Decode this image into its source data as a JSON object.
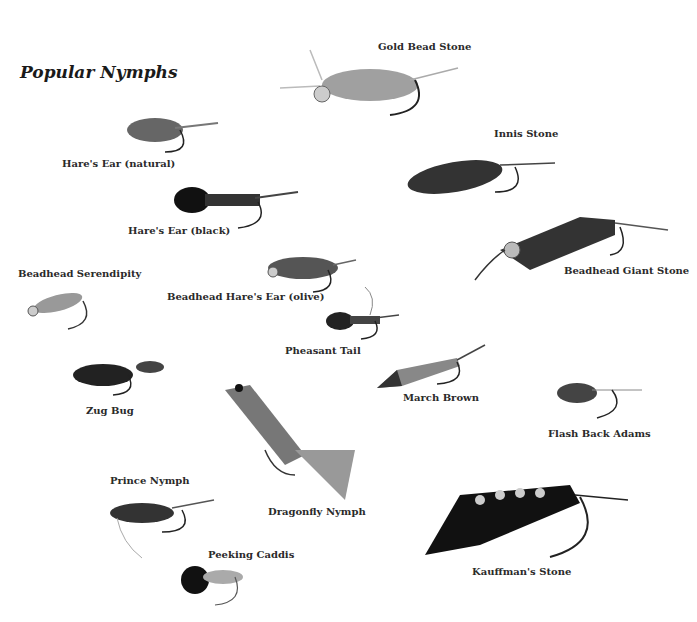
{
  "title": "Popular Nymphs",
  "flies": [
    {
      "name": "Gold Bead Stone"
    },
    {
      "name": "Hare's Ear (natural)"
    },
    {
      "name": "Innis Stone"
    },
    {
      "name": "Hare's Ear (black)"
    },
    {
      "name": "Beadhead Giant Stone"
    },
    {
      "name": "Beadhead Serendipity"
    },
    {
      "name": "Beadhead Hare's Ear (olive)"
    },
    {
      "name": "Pheasant Tail"
    },
    {
      "name": "Zug Bug"
    },
    {
      "name": "March Brown"
    },
    {
      "name": "Flash Back Adams"
    },
    {
      "name": "Prince Nymph"
    },
    {
      "name": "Dragonfly Nymph"
    },
    {
      "name": "Peeking Caddis"
    },
    {
      "name": "Kauffman's Stone"
    }
  ]
}
